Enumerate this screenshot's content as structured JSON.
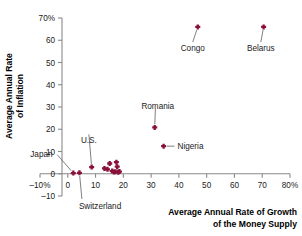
{
  "chart_data": {
    "type": "scatter",
    "title": "",
    "xlabel": "Average Annual Rate of Growth of the Money Supply",
    "xlabel_line1": "Average Annual Rate of Growth",
    "xlabel_line2": "of the Money Supply",
    "ylabel": "Average Annual Rate of Inflation",
    "ylabel_line1": "Average Annual Rate",
    "ylabel_line2": "of Inflation",
    "xlim": [
      -10,
      80
    ],
    "ylim": [
      -10,
      70
    ],
    "grid": false,
    "legend": "none",
    "marker_color": "#8B1038",
    "axis_color": "#8a8a8a",
    "xticks": [
      {
        "value": -10,
        "label": "–10%"
      },
      {
        "value": 0,
        "label": "0"
      },
      {
        "value": 10,
        "label": "10"
      },
      {
        "value": 20,
        "label": "20"
      },
      {
        "value": 30,
        "label": "30"
      },
      {
        "value": 40,
        "label": "40"
      },
      {
        "value": 50,
        "label": "50"
      },
      {
        "value": 60,
        "label": "60"
      },
      {
        "value": 70,
        "label": "70"
      },
      {
        "value": 80,
        "label": "80%"
      }
    ],
    "yticks": [
      {
        "value": -10,
        "label": "–10"
      },
      {
        "value": 0,
        "label": "0"
      },
      {
        "value": 10,
        "label": "10"
      },
      {
        "value": 20,
        "label": "20"
      },
      {
        "value": 30,
        "label": "30"
      },
      {
        "value": 40,
        "label": "40"
      },
      {
        "value": 50,
        "label": "50"
      },
      {
        "value": 60,
        "label": "60"
      },
      {
        "value": 70,
        "label": "70%"
      }
    ],
    "points": [
      {
        "name": "Japan",
        "x": 2.0,
        "y": 0.3,
        "labeled": true
      },
      {
        "name": "Switzerland",
        "x": 4.2,
        "y": 0.4,
        "labeled": true
      },
      {
        "name": "U.S.",
        "x": 8.6,
        "y": 3.0,
        "labeled": true
      },
      {
        "name": "",
        "x": 13.2,
        "y": 2.4,
        "labeled": false
      },
      {
        "name": "",
        "x": 14.3,
        "y": 2.0,
        "labeled": false
      },
      {
        "name": "",
        "x": 15.1,
        "y": 4.6,
        "labeled": false
      },
      {
        "name": "",
        "x": 16.0,
        "y": 1.2,
        "labeled": false
      },
      {
        "name": "",
        "x": 16.6,
        "y": 0.8,
        "labeled": false
      },
      {
        "name": "",
        "x": 17.2,
        "y": 0.9,
        "labeled": false
      },
      {
        "name": "",
        "x": 17.5,
        "y": 5.2,
        "labeled": false
      },
      {
        "name": "",
        "x": 17.8,
        "y": 3.2,
        "labeled": false
      },
      {
        "name": "",
        "x": 18.2,
        "y": 0.7,
        "labeled": false
      },
      {
        "name": "",
        "x": 18.6,
        "y": 1.0,
        "labeled": false
      },
      {
        "name": "Nigeria",
        "x": 34.5,
        "y": 12.4,
        "labeled": true
      },
      {
        "name": "Romania",
        "x": 31.3,
        "y": 20.8,
        "labeled": true
      },
      {
        "name": "Congo",
        "x": 46.8,
        "y": 66.0,
        "labeled": true
      },
      {
        "name": "Belarus",
        "x": 70.5,
        "y": 66.0,
        "labeled": true
      }
    ],
    "annotations": [
      {
        "label": "Congo",
        "point_x": 46.8,
        "point_y": 66.0,
        "text_x": 45.0,
        "text_y": 56.5,
        "anchor": "middle"
      },
      {
        "label": "Belarus",
        "point_x": 70.5,
        "point_y": 66.0,
        "text_x": 69.5,
        "text_y": 56.5,
        "anchor": "middle"
      },
      {
        "label": "Romania",
        "point_x": 31.3,
        "point_y": 20.8,
        "text_x": 26.5,
        "text_y": 30.5,
        "anchor": "start"
      },
      {
        "label": "Nigeria",
        "point_x": 34.5,
        "point_y": 12.4,
        "text_x": 39.5,
        "text_y": 12.4,
        "anchor": "start"
      },
      {
        "label": "U.S.",
        "point_x": 8.6,
        "point_y": 3.0,
        "text_x": 7.6,
        "text_y": 15.0,
        "anchor": "middle"
      },
      {
        "label": "Japan",
        "point_x": 2.0,
        "point_y": 0.3,
        "text_x": -13.5,
        "text_y": 9.0,
        "anchor": "start"
      },
      {
        "label": "Switzerland",
        "point_x": 4.2,
        "point_y": 0.4,
        "text_x": 4.0,
        "text_y": -14.5,
        "anchor": "start"
      }
    ]
  }
}
